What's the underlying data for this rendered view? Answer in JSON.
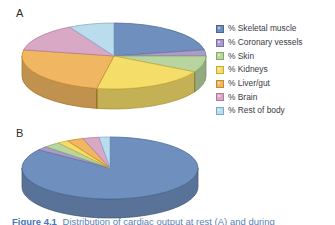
{
  "figure": {
    "panel_a_letter": "A",
    "panel_b_letter": "B",
    "background_color": "#ffffff",
    "caption_number": "Figure 4.1",
    "caption_text": "Distribution of cardiac output at rest (A) and during",
    "caption_color": "#5b7fb4"
  },
  "legend": {
    "position": "right",
    "items": [
      {
        "label": "% Skeletal muscle",
        "color": "#6f8fbe",
        "edge": "#4a6790"
      },
      {
        "label": "% Coronary vessels",
        "color": "#a99cc8",
        "edge": "#7d6fa5"
      },
      {
        "label": "% Skin",
        "color": "#b8d4a0",
        "edge": "#86a96b"
      },
      {
        "label": "% Kidneys",
        "color": "#f5dd6a",
        "edge": "#c9ac33"
      },
      {
        "label": "% Liver/gut",
        "color": "#f0b661",
        "edge": "#c58a2c"
      },
      {
        "label": "% Brain",
        "color": "#d9a8c4",
        "edge": "#b07c9a"
      },
      {
        "label": "% Rest of body",
        "color": "#badced",
        "edge": "#7fa9c9"
      }
    ]
  },
  "chart_data": [
    {
      "id": "pie-a",
      "type": "pie",
      "title": "A",
      "three_d": true,
      "start_angle_deg": 0,
      "direction": "clockwise",
      "categories": [
        "% Skeletal muscle",
        "% Coronary vessels",
        "% Skin",
        "% Kidneys",
        "% Liver/gut",
        "% Brain",
        "% Rest of body"
      ],
      "values": [
        22,
        3,
        8,
        20,
        25,
        14,
        8
      ],
      "unit": "percent",
      "colors": [
        "#6f8fbe",
        "#a99cc8",
        "#b8d4a0",
        "#f5dd6a",
        "#f0b661",
        "#d9a8c4",
        "#badced"
      ],
      "edge_colors": [
        "#4a6790",
        "#7d6fa5",
        "#86a96b",
        "#c9ac33",
        "#c58a2c",
        "#b07c9a",
        "#7fa9c9"
      ],
      "legend": "shared",
      "grid": false
    },
    {
      "id": "pie-b",
      "type": "pie",
      "title": "B",
      "three_d": true,
      "start_angle_deg": 0,
      "direction": "clockwise",
      "categories": [
        "% Skeletal muscle",
        "% Coronary vessels",
        "% Skin",
        "% Kidneys",
        "% Liver/gut",
        "% Brain",
        "% Rest of body"
      ],
      "values": [
        85,
        2,
        3,
        2,
        3,
        3,
        2
      ],
      "unit": "percent",
      "colors": [
        "#6f8fbe",
        "#a99cc8",
        "#b8d4a0",
        "#f5dd6a",
        "#f0b661",
        "#d9a8c4",
        "#badced"
      ],
      "edge_colors": [
        "#4a6790",
        "#7d6fa5",
        "#86a96b",
        "#c9ac33",
        "#c58a2c",
        "#b07c9a",
        "#7fa9c9"
      ],
      "legend": "shared",
      "grid": false
    }
  ]
}
